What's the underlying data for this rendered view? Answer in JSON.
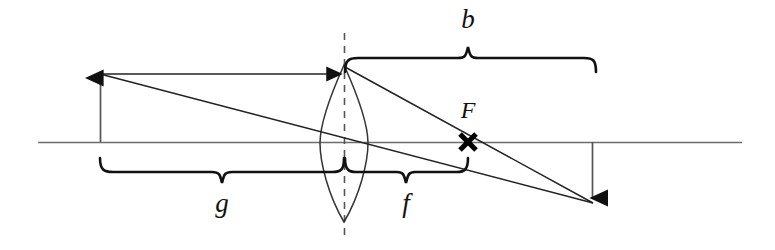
{
  "figure": {
    "kind": "optics-ray-diagram",
    "background_color": "#ffffff",
    "ink_color": "#111111",
    "axis_color": "#6d6d6d"
  },
  "labels": {
    "image_distance": "b",
    "object_distance": "g",
    "focal_length": "f",
    "focal_point": "F"
  },
  "geometry": {
    "optical_axis": {
      "y": 142,
      "x_start": 38,
      "x_end": 742
    },
    "lens": {
      "center_x": 344,
      "top_y": 65,
      "bottom_y": 222,
      "half_width": 23
    },
    "principal_dashed_line": {
      "x": 344,
      "y_top": 33,
      "y_bottom": 240
    },
    "object_arrow": {
      "x": 100,
      "base_y": 142,
      "tip_y": 74
    },
    "image_arrow": {
      "x": 592,
      "base_y": 142,
      "tip_y": 202
    },
    "focal_point_marker": {
      "x": 468,
      "y": 142
    }
  },
  "braces": {
    "b": {
      "x_left": 344,
      "x_right": 597,
      "y": 58,
      "peak_x": 468,
      "direction": "up",
      "label_x": 468,
      "label_y": 28
    },
    "g": {
      "x_left": 100,
      "x_right": 344,
      "y": 172,
      "peak_x": 222,
      "direction": "down",
      "label_x": 222,
      "label_y": 212
    },
    "f": {
      "x_left": 344,
      "x_right": 468,
      "y": 172,
      "peak_x": 406,
      "direction": "down",
      "label_x": 406,
      "label_y": 212
    }
  },
  "rays": [
    {
      "name": "parallel-ray-incoming",
      "from": [
        100,
        74
      ],
      "to": [
        345,
        74
      ],
      "arrowhead": true
    },
    {
      "name": "refracted-ray-through-focus",
      "from": [
        345,
        68
      ],
      "to": [
        592,
        202
      ],
      "arrowhead": false
    },
    {
      "name": "chief-ray-through-center",
      "from": [
        100,
        74
      ],
      "to": [
        592,
        202
      ],
      "arrowhead": false
    }
  ]
}
